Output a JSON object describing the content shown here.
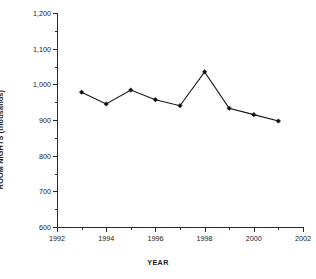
{
  "chart_data": {
    "type": "line",
    "title": "",
    "xlabel": "YEAR",
    "ylabel": "ROOM NIGHTS (thousands)",
    "x": [
      1993,
      1994,
      1995,
      1996,
      1997,
      1998,
      1999,
      2000,
      2001
    ],
    "values": [
      978,
      945,
      984,
      957,
      940,
      1035,
      933,
      915,
      897
    ],
    "series": [
      {
        "name": "Room nights",
        "values": [
          978,
          945,
          984,
          957,
          940,
          1035,
          933,
          915,
          897
        ]
      }
    ],
    "xlim": [
      1992,
      2002
    ],
    "ylim": [
      600,
      1200
    ],
    "x_major_ticks": [
      1992,
      1994,
      1996,
      1998,
      2000,
      2002
    ],
    "x_minor_ticks": [
      1993,
      1995,
      1997,
      1999,
      2001
    ],
    "x_tick_labels": [
      "1992",
      "1994",
      "1996",
      "1998",
      "2000",
      "2002"
    ],
    "y_major_ticks": [
      600,
      700,
      800,
      900,
      1000,
      1100,
      1200
    ],
    "y_minor_ticks": [
      650,
      750,
      850,
      950,
      1050,
      1150
    ],
    "y_tick_labels": [
      "600",
      "700",
      "800",
      "900",
      "1,000",
      "1,100",
      "1,200"
    ],
    "grid": false,
    "legend": null,
    "marker": "filled-diamond",
    "line_color": "#111111",
    "marker_color": "#111111",
    "axis_color": "#2b2b2b",
    "background": "#ffffff"
  }
}
